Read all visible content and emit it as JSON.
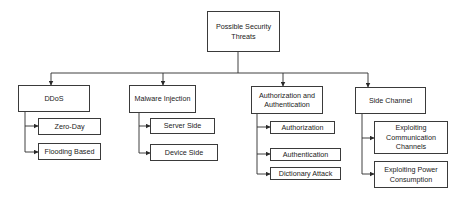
{
  "diagram": {
    "type": "hierarchy",
    "root": {
      "label": "Possible Security Threats"
    },
    "categories": [
      {
        "label": "DDoS",
        "children": [
          {
            "label": "Zero-Day"
          },
          {
            "label": "Flooding Based"
          }
        ]
      },
      {
        "label": "Malware Injection",
        "children": [
          {
            "label": "Server Side"
          },
          {
            "label": "Device Side"
          }
        ]
      },
      {
        "label": "Authorization and Authentication",
        "children": [
          {
            "label": "Authorization"
          },
          {
            "label": "Authentication"
          },
          {
            "label": "Dictionary Attack"
          }
        ]
      },
      {
        "label": "Side Channel",
        "children": [
          {
            "label": "Exploiting Communication Channels"
          },
          {
            "label": "Exploiting Power Consumption"
          }
        ]
      }
    ],
    "colors": {
      "line": "#2a2a2a",
      "border": "#3a3a3a",
      "text": "#222222",
      "background": "#ffffff"
    }
  }
}
